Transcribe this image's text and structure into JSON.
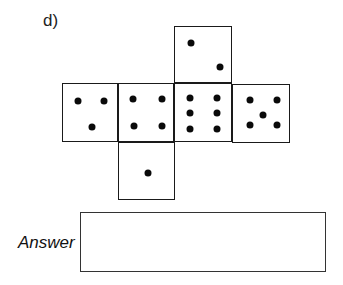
{
  "question": {
    "label": "d)"
  },
  "net": {
    "description": "Unfolded cube net of a die",
    "faces": [
      {
        "id": "top",
        "value": 2,
        "box": [
          174,
          26,
          58,
          57
        ],
        "dots": [
          [
            16,
            16
          ],
          [
            45,
            40
          ]
        ]
      },
      {
        "id": "left",
        "value": 3,
        "box": [
          62,
          83,
          56,
          59
        ],
        "dots": [
          [
            15,
            17
          ],
          [
            41,
            17
          ],
          [
            29,
            43
          ]
        ]
      },
      {
        "id": "center-left",
        "value": 4,
        "box": [
          118,
          83,
          56,
          59
        ],
        "dots": [
          [
            14,
            15
          ],
          [
            43,
            15
          ],
          [
            15,
            42
          ],
          [
            43,
            42
          ]
        ]
      },
      {
        "id": "center",
        "value": 6,
        "box": [
          174,
          83,
          58,
          59
        ],
        "dots": [
          [
            15,
            14
          ],
          [
            42,
            14
          ],
          [
            15,
            29
          ],
          [
            42,
            29
          ],
          [
            15,
            45
          ],
          [
            42,
            45
          ]
        ]
      },
      {
        "id": "right",
        "value": 5,
        "box": [
          232,
          84,
          58,
          59
        ],
        "dots": [
          [
            17,
            15
          ],
          [
            44,
            15
          ],
          [
            30,
            30
          ],
          [
            17,
            40
          ],
          [
            44,
            40
          ]
        ]
      },
      {
        "id": "bottom",
        "value": 1,
        "box": [
          118,
          142,
          57,
          58
        ],
        "dots": [
          [
            29,
            30
          ]
        ]
      }
    ]
  },
  "answer": {
    "label": "Answer",
    "value": ""
  }
}
